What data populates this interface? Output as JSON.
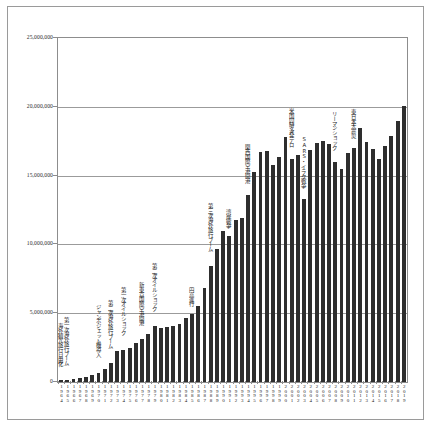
{
  "chart_data": {
    "type": "bar",
    "title": "",
    "subtitle": "",
    "xlabel": "",
    "ylabel": "",
    "ylim": [
      0,
      25000000
    ],
    "grid": true,
    "legend": null,
    "ytick_labels": [
      "25,000,000",
      "20,000,000",
      "15,000,000",
      "10,000,000",
      "5,000,000",
      "0"
    ],
    "ytick_values": [
      25000000,
      20000000,
      15000000,
      10000000,
      5000000,
      0
    ],
    "categories": [
      "1964",
      "1965",
      "1966",
      "1967",
      "1968",
      "1969",
      "1970",
      "1971",
      "1972",
      "1973",
      "1974",
      "1975",
      "1976",
      "1977",
      "1978",
      "1979",
      "1980",
      "1981",
      "1982",
      "1983",
      "1984",
      "1985",
      "1986",
      "1987",
      "1988",
      "1989",
      "1990",
      "1991",
      "1992",
      "1993",
      "1994",
      "1995",
      "1996",
      "1997",
      "1998",
      "1999",
      "2000",
      "2001",
      "2002",
      "2003",
      "2004",
      "2005",
      "2006",
      "2007",
      "2008",
      "2009",
      "2010",
      "2011",
      "2012",
      "2013",
      "2014",
      "2015",
      "2016",
      "2017",
      "2018",
      "2019"
    ],
    "values": [
      127749,
      158827,
      212409,
      267538,
      343542,
      492880,
      663467,
      961135,
      1392045,
      2288966,
      2335530,
      2466326,
      2852584,
      3151431,
      3525110,
      4038298,
      3909333,
      4006388,
      4086138,
      4232246,
      4658833,
      4948366,
      5516193,
      6829338,
      8426867,
      9662752,
      10997431,
      10633777,
      11790699,
      11933620,
      13578934,
      15298125,
      16694769,
      16802750,
      15806218,
      16357572,
      17818590,
      16215657,
      16522804,
      13296330,
      16831112,
      17403565,
      17534565,
      17294935,
      15987250,
      15445684,
      16637224,
      16994200,
      18490657,
      17472748,
      16903388,
      16213789,
      17116420,
      17889292,
      18954031,
      20080669
    ],
    "annotations": [
      {
        "text": "海外観光旅行自由化",
        "year_index": 0
      },
      {
        "text": "第一次海外旅行ブーム",
        "year_index": 1
      },
      {
        "text": "ジャンボジェット機導入",
        "year_index": 6
      },
      {
        "text": "第二次海外旅行ブーム",
        "year_index": 8
      },
      {
        "text": "第一次オイルショック",
        "year_index": 10
      },
      {
        "text": "新東京国際空港開港",
        "year_index": 13
      },
      {
        "text": "第二次オイルショック",
        "year_index": 15
      },
      {
        "text": "円高進行",
        "year_index": 21
      },
      {
        "text": "第三次海外旅行ブーム",
        "year_index": 24
      },
      {
        "text": "湾岸戦争",
        "year_index": 27
      },
      {
        "text": "関西国際空港開港",
        "year_index": 30
      },
      {
        "text": "米国同時多発テロ",
        "year_index": 37
      },
      {
        "text": "SARS・イラク戦争",
        "year_index": 39
      },
      {
        "text": "リーマンショック",
        "year_index": 44
      },
      {
        "text": "東日本大震災",
        "year_index": 47
      }
    ]
  },
  "colors": {
    "bar": "#2e2e2e",
    "gridline": "#9b9b9b",
    "axis": "#8d8d8d",
    "frame": "#9a9a9a",
    "text": "#232323",
    "background": "#ffffff"
  }
}
